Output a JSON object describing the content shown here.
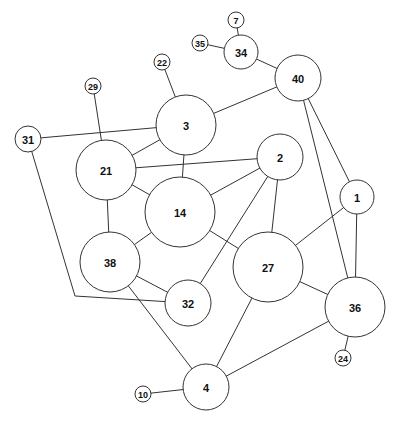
{
  "graph": {
    "nodes": [
      {
        "id": "7",
        "label": "7",
        "x": 236,
        "y": 20,
        "r": 8
      },
      {
        "id": "35",
        "label": "35",
        "x": 200,
        "y": 43,
        "r": 8
      },
      {
        "id": "34",
        "label": "34",
        "x": 241,
        "y": 52,
        "r": 17
      },
      {
        "id": "40",
        "label": "40",
        "x": 298,
        "y": 78,
        "r": 23
      },
      {
        "id": "22",
        "label": "22",
        "x": 162,
        "y": 62,
        "r": 8
      },
      {
        "id": "29",
        "label": "29",
        "x": 93,
        "y": 86,
        "r": 8
      },
      {
        "id": "31",
        "label": "31",
        "x": 28,
        "y": 139,
        "r": 13
      },
      {
        "id": "3",
        "label": "3",
        "x": 186,
        "y": 125,
        "r": 30
      },
      {
        "id": "21",
        "label": "21",
        "x": 106,
        "y": 170,
        "r": 30
      },
      {
        "id": "2",
        "label": "2",
        "x": 280,
        "y": 157,
        "r": 23
      },
      {
        "id": "14",
        "label": "14",
        "x": 180,
        "y": 212,
        "r": 35
      },
      {
        "id": "1",
        "label": "1",
        "x": 357,
        "y": 197,
        "r": 17
      },
      {
        "id": "38",
        "label": "38",
        "x": 110,
        "y": 262,
        "r": 30
      },
      {
        "id": "27",
        "label": "27",
        "x": 268,
        "y": 267,
        "r": 35
      },
      {
        "id": "32",
        "label": "32",
        "x": 188,
        "y": 303,
        "r": 23
      },
      {
        "id": "36",
        "label": "36",
        "x": 355,
        "y": 307,
        "r": 30
      },
      {
        "id": "24",
        "label": "24",
        "x": 343,
        "y": 358,
        "r": 8
      },
      {
        "id": "4",
        "label": "4",
        "x": 206,
        "y": 387,
        "r": 23
      },
      {
        "id": "10",
        "label": "10",
        "x": 143,
        "y": 394,
        "r": 8
      }
    ],
    "edges": [
      {
        "from": "7",
        "to": "34"
      },
      {
        "from": "35",
        "to": "34"
      },
      {
        "from": "34",
        "to": "40"
      },
      {
        "from": "40",
        "to": "3"
      },
      {
        "from": "40",
        "to": "1"
      },
      {
        "from": "40",
        "to": "36"
      },
      {
        "from": "22",
        "to": "3"
      },
      {
        "from": "29",
        "to": "21"
      },
      {
        "from": "31",
        "to": "3"
      },
      {
        "from": "31",
        "to": "32",
        "via": [
          [
            75,
            296
          ]
        ]
      },
      {
        "from": "3",
        "to": "21"
      },
      {
        "from": "3",
        "to": "14"
      },
      {
        "from": "21",
        "to": "2"
      },
      {
        "from": "21",
        "to": "14"
      },
      {
        "from": "21",
        "to": "38"
      },
      {
        "from": "2",
        "to": "14"
      },
      {
        "from": "2",
        "to": "27"
      },
      {
        "from": "2",
        "to": "32"
      },
      {
        "from": "14",
        "to": "38"
      },
      {
        "from": "14",
        "to": "27"
      },
      {
        "from": "1",
        "to": "27"
      },
      {
        "from": "1",
        "to": "36"
      },
      {
        "from": "38",
        "to": "32"
      },
      {
        "from": "38",
        "to": "4"
      },
      {
        "from": "27",
        "to": "36"
      },
      {
        "from": "27",
        "to": "4"
      },
      {
        "from": "36",
        "to": "24"
      },
      {
        "from": "36",
        "to": "4"
      },
      {
        "from": "10",
        "to": "4"
      }
    ]
  },
  "colors": {
    "stroke": "#333333",
    "fill": "#ffffff",
    "text": "#111111",
    "background": "#ffffff"
  }
}
